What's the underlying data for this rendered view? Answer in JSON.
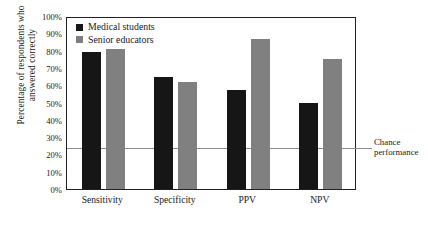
{
  "chart_data": {
    "type": "bar",
    "title": "",
    "xlabel": "",
    "ylabel_line1": "Percentage of respondents who",
    "ylabel_line2": "answered correctly",
    "categories": [
      "Sensitivity",
      "Specificity",
      "PPV",
      "NPV"
    ],
    "series": [
      {
        "name": "Medical students",
        "color": "#161616",
        "values": [
          79,
          65,
          57,
          50
        ]
      },
      {
        "name": "Senior educators",
        "color": "#808080",
        "values": [
          81,
          62,
          87,
          75
        ]
      }
    ],
    "ylim": [
      0,
      100
    ],
    "ytick_values": [
      0,
      10,
      20,
      30,
      40,
      50,
      60,
      70,
      80,
      90,
      100
    ],
    "ytick_labels": [
      "0%",
      "10%",
      "20%",
      "30%",
      "40%",
      "50%",
      "60%",
      "70%",
      "80%",
      "90%",
      "100%"
    ],
    "grid": false,
    "legend_position": "top-left",
    "annotations": [
      {
        "name": "chance-performance",
        "line1": "Chance",
        "line2": "performance",
        "value": 25,
        "line_color": "#8d8d8d"
      }
    ]
  }
}
